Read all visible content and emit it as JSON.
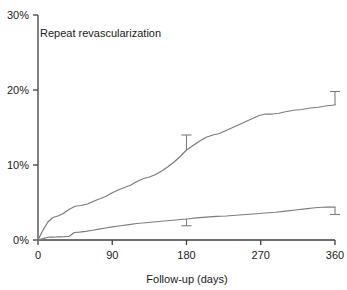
{
  "chart_data": {
    "type": "line",
    "title": "Repeat revascularization",
    "xlabel": "Follow-up (days)",
    "ylabel": "",
    "xlim": [
      0,
      360
    ],
    "ylim": [
      0,
      30
    ],
    "xticks": [
      0,
      90,
      180,
      270,
      360
    ],
    "xtick_labels": [
      "0",
      "90",
      "180",
      "270",
      "360"
    ],
    "yticks": [
      0,
      10,
      20,
      30
    ],
    "ytick_labels": [
      "0%",
      "10%",
      "20%",
      "30%"
    ],
    "grid": false,
    "legend": "none",
    "line_color": "#7d7d7d",
    "axis_color": "#404040",
    "text_color": "#1a1a1a",
    "series": [
      {
        "name": "upper-curve",
        "x": [
          0,
          6,
          12,
          18,
          24,
          30,
          38,
          45,
          52,
          60,
          68,
          75,
          82,
          90,
          98,
          105,
          112,
          120,
          128,
          135,
          142,
          150,
          158,
          165,
          172,
          180,
          188,
          196,
          204,
          212,
          220,
          228,
          236,
          244,
          252,
          260,
          268,
          276,
          284,
          292,
          300,
          310,
          320,
          330,
          340,
          350,
          360
        ],
        "y": [
          0.0,
          1.3,
          2.4,
          3.0,
          3.2,
          3.5,
          4.1,
          4.5,
          4.6,
          4.8,
          5.2,
          5.5,
          5.8,
          6.3,
          6.7,
          7.0,
          7.3,
          7.8,
          8.2,
          8.4,
          8.7,
          9.2,
          9.8,
          10.4,
          11.1,
          12.0,
          12.6,
          13.2,
          13.7,
          14.0,
          14.2,
          14.6,
          15.0,
          15.4,
          15.8,
          16.2,
          16.6,
          16.8,
          16.8,
          16.9,
          17.1,
          17.3,
          17.4,
          17.6,
          17.7,
          17.9,
          18.0
        ]
      },
      {
        "name": "lower-curve",
        "x": [
          0,
          8,
          14,
          20,
          26,
          32,
          38,
          44,
          50,
          58,
          66,
          74,
          82,
          90,
          100,
          110,
          120,
          130,
          140,
          150,
          160,
          170,
          180,
          192,
          204,
          216,
          228,
          240,
          252,
          264,
          276,
          288,
          300,
          312,
          324,
          336,
          348,
          360
        ],
        "y": [
          0.0,
          0.25,
          0.4,
          0.4,
          0.42,
          0.45,
          0.5,
          1.0,
          1.05,
          1.15,
          1.3,
          1.45,
          1.6,
          1.75,
          1.9,
          2.05,
          2.2,
          2.3,
          2.4,
          2.5,
          2.6,
          2.7,
          2.8,
          2.95,
          3.05,
          3.15,
          3.2,
          3.3,
          3.4,
          3.5,
          3.6,
          3.7,
          3.85,
          4.0,
          4.15,
          4.3,
          4.4,
          4.4
        ]
      }
    ],
    "error_bars": [
      {
        "series": "upper-curve",
        "x": 180,
        "y": 12.0,
        "upper": 14.0,
        "lower": 12.0,
        "direction": "up"
      },
      {
        "series": "upper-curve",
        "x": 360,
        "y": 18.0,
        "upper": 19.8,
        "lower": 18.0,
        "direction": "up"
      },
      {
        "series": "lower-curve",
        "x": 180,
        "y": 2.8,
        "upper": 2.8,
        "lower": 1.9,
        "direction": "down"
      },
      {
        "series": "lower-curve",
        "x": 360,
        "y": 4.4,
        "upper": 4.4,
        "lower": 3.4,
        "direction": "down"
      }
    ]
  }
}
